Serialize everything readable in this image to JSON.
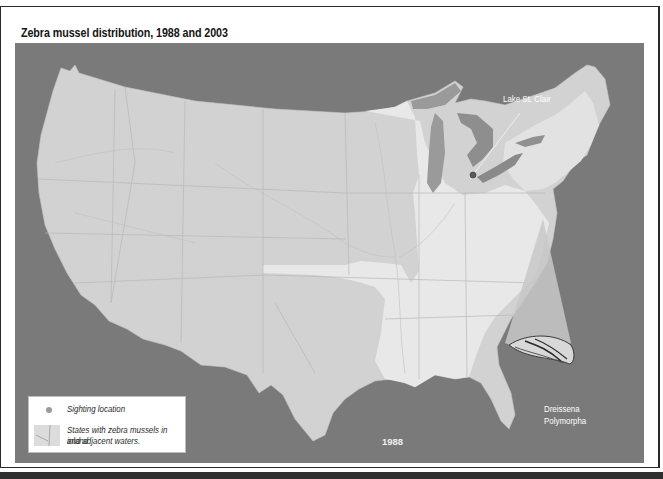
{
  "figure": {
    "title": "Zebra mussel distribution, 1988 and 2003",
    "year": "1988"
  },
  "map": {
    "callouts": {
      "lake": "Lake St. Clair",
      "species_line1": "Dreissena",
      "species_line2": "Polymorpha"
    },
    "colors": {
      "water": "#7a7a7a",
      "land": "#d4d4d4",
      "highlighted_states": "#e6e6e6",
      "great_lakes": "#9a9a9a",
      "sighting": "#5a5a5a"
    }
  },
  "legend": {
    "items": [
      {
        "icon": "sighting-dot-icon",
        "label": "Sighting location"
      },
      {
        "icon": "state-swatch-icon",
        "label_line1": "States with zebra mussels in inland",
        "label_line2": "and adjacent waters."
      }
    ]
  }
}
